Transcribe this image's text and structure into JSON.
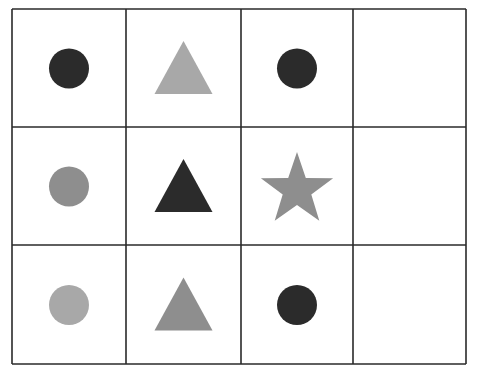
{
  "puzzle": {
    "rows": 3,
    "cols": 4,
    "grid": {
      "x_lines": [
        12,
        126,
        241,
        353,
        466
      ],
      "y_lines": [
        9,
        127,
        245,
        364
      ],
      "line_color": "#2a2a2a"
    },
    "colors": {
      "dark": "#2b2b2b",
      "mid": "#8e8e8e",
      "light": "#a8a8a8"
    },
    "cells": [
      {
        "row": 0,
        "col": 0,
        "shape": "circle",
        "shade": "dark"
      },
      {
        "row": 0,
        "col": 1,
        "shape": "triangle",
        "shade": "light"
      },
      {
        "row": 0,
        "col": 2,
        "shape": "circle",
        "shade": "dark"
      },
      {
        "row": 0,
        "col": 3,
        "shape": "empty",
        "shade": ""
      },
      {
        "row": 1,
        "col": 0,
        "shape": "circle",
        "shade": "mid"
      },
      {
        "row": 1,
        "col": 1,
        "shape": "triangle",
        "shade": "dark"
      },
      {
        "row": 1,
        "col": 2,
        "shape": "star",
        "shade": "mid"
      },
      {
        "row": 1,
        "col": 3,
        "shape": "empty",
        "shade": ""
      },
      {
        "row": 2,
        "col": 0,
        "shape": "circle",
        "shade": "light"
      },
      {
        "row": 2,
        "col": 1,
        "shape": "triangle",
        "shade": "mid"
      },
      {
        "row": 2,
        "col": 2,
        "shape": "circle",
        "shade": "dark"
      },
      {
        "row": 2,
        "col": 3,
        "shape": "empty",
        "shade": ""
      }
    ]
  }
}
